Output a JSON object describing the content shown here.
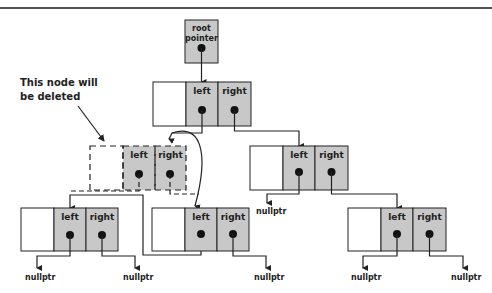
{
  "diagram": {
    "annotation": {
      "line1": "This node will",
      "line2": "be deleted"
    },
    "root_pointer": {
      "line1": "root",
      "line2": "pointer"
    },
    "field_labels": {
      "left": "left",
      "right": "right"
    },
    "null_label": "nullptr",
    "colors": {
      "cell_fill": "#c8c8c8",
      "stroke": "#222222",
      "background": "#ffffff"
    },
    "nodes": [
      {
        "id": "root",
        "x": 153,
        "y": 82,
        "dashed": false
      },
      {
        "id": "deleted",
        "x": 90,
        "y": 146,
        "dashed": true
      },
      {
        "id": "right-child",
        "x": 250,
        "y": 146,
        "dashed": false
      },
      {
        "id": "bottom-left",
        "x": 21,
        "y": 208,
        "dashed": false
      },
      {
        "id": "bottom-middle",
        "x": 152,
        "y": 208,
        "dashed": false
      },
      {
        "id": "bottom-right",
        "x": 348,
        "y": 208,
        "dashed": false
      }
    ]
  }
}
